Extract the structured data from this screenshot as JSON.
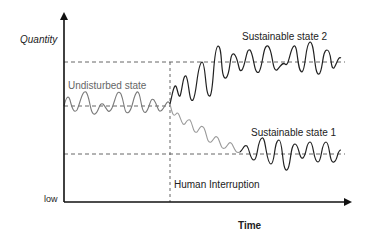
{
  "diagram": {
    "y_axis_label": "Quantity",
    "y_axis_low_label": "low",
    "x_axis_label": "Time",
    "event_label": "Human Interruption",
    "states": {
      "undisturbed": "Undisturbed state",
      "sustainable_2": "Sustainable state 2",
      "sustainable_1": "Sustainable state 1"
    },
    "colors": {
      "axis": "#111111",
      "undisturbed_wave": "#777777",
      "declining_wave": "#999999",
      "sustainable_wave": "#222222",
      "dashed": "#555555"
    }
  }
}
